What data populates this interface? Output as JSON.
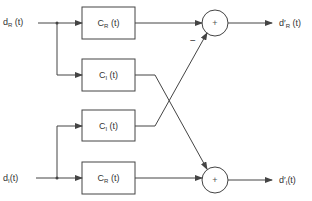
{
  "diagram": {
    "inputs": [
      {
        "id": "dR",
        "base": "d",
        "sub": "R",
        "arg": " (t)"
      },
      {
        "id": "dI",
        "base": "d",
        "sub": "I",
        "arg": "(t)"
      }
    ],
    "blocks": [
      {
        "id": "b1",
        "base": "C",
        "sub": "R",
        "arg": " (t)"
      },
      {
        "id": "b2",
        "base": "C",
        "sub": "I",
        "arg": " (t)"
      },
      {
        "id": "b3",
        "base": "C",
        "sub": "I",
        "arg": " (t)"
      },
      {
        "id": "b4",
        "base": "C",
        "sub": "R",
        "arg": " (t)"
      }
    ],
    "summers": [
      {
        "id": "s1",
        "symbol": "+",
        "minus_label": "−"
      },
      {
        "id": "s2",
        "symbol": "+"
      }
    ],
    "outputs": [
      {
        "id": "dR_out",
        "base": "d′",
        "sub": "R",
        "arg": " (t)"
      },
      {
        "id": "dI_out",
        "base": "d′",
        "sub": "I",
        "arg": "(t)"
      }
    ],
    "colors": {
      "line": "#444444",
      "text": "#333333",
      "background": "#ffffff"
    }
  }
}
